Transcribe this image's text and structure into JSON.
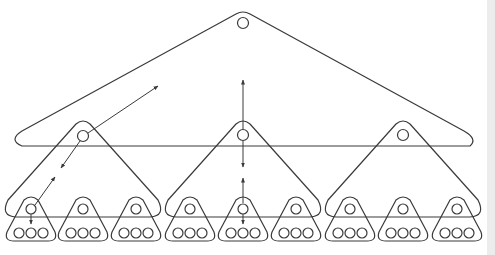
{
  "diagram": {
    "type": "hierarchical-tree",
    "colors": {
      "stroke": "#3a3a3a",
      "background": "#ffffff"
    },
    "levels": [
      {
        "level": 0,
        "count": 1,
        "label": ""
      },
      {
        "level": 1,
        "count": 3,
        "label": ""
      },
      {
        "level": 2,
        "count": 9,
        "label": ""
      }
    ],
    "leaf_circles_per_node": 3,
    "arrows": [
      {
        "from": "level1-node0",
        "to": "level0",
        "direction": "up-right"
      },
      {
        "from": "level1-node0",
        "to": "level2-node0",
        "direction": "bidirectional"
      },
      {
        "from": "level1-node1",
        "to": "level0",
        "direction": "up"
      },
      {
        "from": "level1-node1",
        "to": "level2-node4",
        "direction": "bidirectional"
      }
    ]
  }
}
